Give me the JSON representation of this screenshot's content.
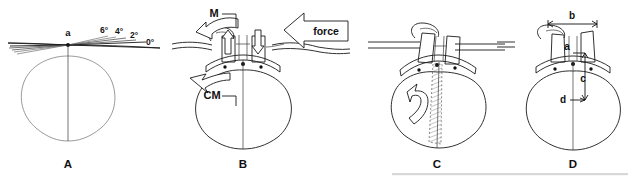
{
  "figure": {
    "background_color": "#ffffff",
    "ink_color": "#111111",
    "width": 631,
    "height": 179
  },
  "panels": [
    {
      "id": "A",
      "letter": "A",
      "letter_x": 68,
      "letter_y": 168,
      "apex_label": "a",
      "angle_labels": [
        {
          "text": "6°",
          "x": 104,
          "y": 33
        },
        {
          "text": "4°",
          "x": 119,
          "y": 34
        },
        {
          "text": "2°",
          "x": 134,
          "y": 38
        },
        {
          "text": "0°",
          "x": 150,
          "y": 45
        }
      ]
    },
    {
      "id": "B",
      "letter": "B",
      "letter_x": 243,
      "letter_y": 168,
      "moment_label": "M",
      "force_label": "force",
      "cm_label": "CM",
      "up_arrow_name": "reaction-arrow-up",
      "down_arrow_name": "load-arrow-down"
    },
    {
      "id": "C",
      "letter": "C",
      "letter_x": 437,
      "letter_y": 168,
      "rotation_arrow_name": "rotation-arrow"
    },
    {
      "id": "D",
      "letter": "D",
      "letter_x": 573,
      "letter_y": 168,
      "dimension_labels": [
        {
          "text": "b",
          "x": 572,
          "y": 19,
          "kind": "horizontal-width"
        },
        {
          "text": "a",
          "x": 567,
          "y": 48,
          "kind": "point"
        },
        {
          "text": "c",
          "x": 583,
          "y": 80,
          "kind": "vertical-height"
        },
        {
          "text": "d",
          "x": 564,
          "y": 100,
          "kind": "depth-pointer"
        }
      ]
    }
  ]
}
